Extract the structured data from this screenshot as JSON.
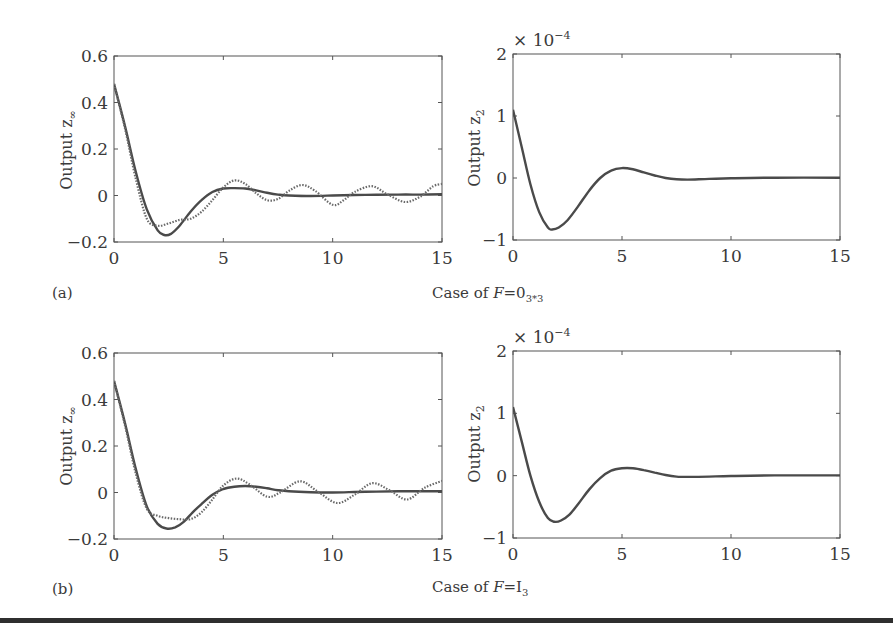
{
  "figure": {
    "panel_a": {
      "label": "(a)",
      "caption_prefix": "Case of ",
      "caption_var": "F",
      "caption_eq": "=0",
      "caption_sub": "3*3"
    },
    "panel_b": {
      "label": "(b)",
      "caption_prefix": "Case of ",
      "caption_var": "F",
      "caption_eq": "=I",
      "caption_sub": "3"
    },
    "left_ylabel": "Output z",
    "left_ylabel_sub": "∞",
    "right_ylabel": "Output z",
    "right_ylabel_sub": "2",
    "right_multiplier": "× 10",
    "right_multiplier_exp": "−4",
    "rule_color": "#2f2f2f"
  },
  "chart_data": [
    {
      "type": "line",
      "panel": "a-left",
      "xlabel": "",
      "ylabel": "Output z∞",
      "xlim": [
        0,
        15
      ],
      "ylim": [
        -0.2,
        0.6
      ],
      "xticks": [
        "0",
        "5",
        "10",
        "15"
      ],
      "yticks": [
        "−0.2",
        "0",
        "0.2",
        "0.4",
        "0.6"
      ],
      "series": [
        {
          "name": "solid",
          "style": "solid",
          "x": [
            0,
            0.5,
            1,
            1.5,
            2,
            2.3,
            2.6,
            3,
            3.5,
            4,
            4.5,
            5,
            5.5,
            6,
            6.5,
            7,
            7.5,
            8,
            9,
            10,
            11,
            12,
            13,
            14,
            15
          ],
          "y": [
            0.48,
            0.3,
            0.1,
            -0.06,
            -0.15,
            -0.17,
            -0.165,
            -0.13,
            -0.07,
            -0.02,
            0.015,
            0.03,
            0.032,
            0.03,
            0.022,
            0.012,
            0.004,
            0.0,
            -0.002,
            0.0,
            0.002,
            0.003,
            0.004,
            0.004,
            0.005
          ]
        },
        {
          "name": "dotted",
          "style": "dotted",
          "x": [
            0,
            0.5,
            1,
            1.5,
            2,
            2.5,
            3,
            3.5,
            4,
            4.5,
            5,
            5.5,
            6,
            6.5,
            7,
            7.5,
            8,
            8.6,
            9.2,
            10,
            10.5,
            11,
            11.8,
            12.5,
            13.3,
            14,
            14.6,
            15
          ],
          "y": [
            0.48,
            0.29,
            0.07,
            -0.1,
            -0.13,
            -0.12,
            -0.105,
            -0.1,
            -0.07,
            -0.02,
            0.035,
            0.065,
            0.05,
            0.01,
            -0.02,
            -0.015,
            0.02,
            0.045,
            0.02,
            -0.04,
            -0.02,
            0.015,
            0.04,
            0.005,
            -0.028,
            -0.005,
            0.04,
            0.05
          ]
        }
      ]
    },
    {
      "type": "line",
      "panel": "a-right",
      "xlabel": "",
      "ylabel": "Output z2",
      "multiplier": "×10^-4",
      "xlim": [
        0,
        15
      ],
      "ylim": [
        -1,
        2
      ],
      "xticks": [
        "0",
        "5",
        "10",
        "15"
      ],
      "yticks": [
        "−1",
        "0",
        "1",
        "2"
      ],
      "series": [
        {
          "name": "response",
          "style": "solid",
          "x": [
            0,
            0.4,
            0.8,
            1.2,
            1.6,
            1.8,
            2.1,
            2.5,
            3,
            3.5,
            4,
            4.5,
            5,
            5.5,
            6,
            6.5,
            7,
            7.5,
            8,
            9,
            10,
            12,
            15
          ],
          "y": [
            1.1,
            0.5,
            -0.1,
            -0.55,
            -0.8,
            -0.83,
            -0.8,
            -0.68,
            -0.45,
            -0.2,
            0.0,
            0.12,
            0.16,
            0.14,
            0.09,
            0.04,
            0.0,
            -0.02,
            -0.025,
            -0.015,
            -0.005,
            0.005,
            0.005
          ]
        }
      ]
    },
    {
      "type": "line",
      "panel": "b-left",
      "xlabel": "",
      "ylabel": "Output z∞",
      "xlim": [
        0,
        15
      ],
      "ylim": [
        -0.2,
        0.6
      ],
      "xticks": [
        "0",
        "5",
        "10",
        "15"
      ],
      "yticks": [
        "−0.2",
        "0",
        "0.2",
        "0.4",
        "0.6"
      ],
      "series": [
        {
          "name": "solid",
          "style": "solid",
          "x": [
            0,
            0.5,
            1,
            1.5,
            2,
            2.4,
            2.8,
            3.2,
            3.6,
            4,
            4.5,
            5,
            5.5,
            6,
            6.5,
            7,
            7.5,
            8,
            9,
            10,
            11,
            12,
            13,
            14,
            15
          ],
          "y": [
            0.48,
            0.3,
            0.1,
            -0.06,
            -0.135,
            -0.155,
            -0.15,
            -0.125,
            -0.085,
            -0.05,
            -0.01,
            0.015,
            0.025,
            0.028,
            0.025,
            0.018,
            0.01,
            0.005,
            0.001,
            0.0,
            0.002,
            0.004,
            0.005,
            0.005,
            0.005
          ]
        },
        {
          "name": "dotted",
          "style": "dotted",
          "x": [
            0,
            0.5,
            1,
            1.5,
            2,
            2.5,
            3,
            3.5,
            4,
            4.5,
            5,
            5.6,
            6.2,
            7,
            7.6,
            8.5,
            9.3,
            10.2,
            11,
            11.8,
            12.6,
            13.4,
            14.2,
            15
          ],
          "y": [
            0.48,
            0.29,
            0.08,
            -0.07,
            -0.1,
            -0.11,
            -0.115,
            -0.115,
            -0.085,
            -0.03,
            0.03,
            0.06,
            0.035,
            -0.018,
            0.0,
            0.048,
            0.005,
            -0.045,
            -0.01,
            0.04,
            0.01,
            -0.03,
            0.02,
            0.05
          ]
        }
      ]
    },
    {
      "type": "line",
      "panel": "b-right",
      "xlabel": "",
      "ylabel": "Output z2",
      "multiplier": "×10^-4",
      "xlim": [
        0,
        15
      ],
      "ylim": [
        -1,
        2
      ],
      "xticks": [
        "0",
        "5",
        "10",
        "15"
      ],
      "yticks": [
        "−1",
        "0",
        "1",
        "2"
      ],
      "series": [
        {
          "name": "response",
          "style": "solid",
          "x": [
            0,
            0.4,
            0.8,
            1.2,
            1.6,
            1.9,
            2.2,
            2.6,
            3,
            3.5,
            4,
            4.5,
            5,
            5.5,
            6,
            6.5,
            7,
            7.5,
            8,
            9,
            10,
            12,
            15
          ],
          "y": [
            1.1,
            0.55,
            0.0,
            -0.42,
            -0.68,
            -0.74,
            -0.72,
            -0.62,
            -0.45,
            -0.22,
            -0.04,
            0.08,
            0.12,
            0.12,
            0.09,
            0.05,
            0.01,
            -0.015,
            -0.02,
            -0.015,
            -0.005,
            0.005,
            0.005
          ]
        }
      ]
    }
  ]
}
